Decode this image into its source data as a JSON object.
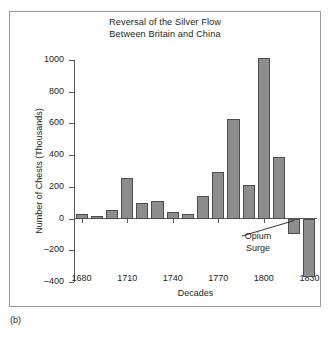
{
  "caption": "(b)",
  "chart_data": {
    "type": "bar",
    "title": "Reversal of the Silver Flow Between Britain and China",
    "title_lines": [
      "Reversal of the Silver Flow",
      "Between Britain and China"
    ],
    "xlabel": "Decades",
    "ylabel": "Number of Chests (Thousands)",
    "ylim": [
      -400,
      1000
    ],
    "yticks": [
      1000,
      800,
      600,
      400,
      200,
      0,
      -200,
      -400
    ],
    "ytick_labels": [
      "1000",
      "800",
      "600",
      "400",
      "200",
      "0",
      "–200",
      "–400"
    ],
    "xticks": [
      1680,
      1710,
      1740,
      1770,
      1800,
      1830
    ],
    "xtick_labels": [
      "1680",
      "1710",
      "1740",
      "1770",
      "1800",
      "1830"
    ],
    "grid": false,
    "legend": null,
    "bar_color": "#8d8d8d",
    "bar_edge_color": "#4d4d4d",
    "categories": [
      1680,
      1690,
      1700,
      1710,
      1720,
      1730,
      1740,
      1750,
      1760,
      1770,
      1780,
      1790,
      1800,
      1810,
      1820,
      1830
    ],
    "values": [
      30,
      15,
      55,
      255,
      100,
      110,
      40,
      30,
      140,
      295,
      630,
      210,
      1010,
      390,
      -95,
      -370
    ],
    "annotations": [
      {
        "text": "Opium Surge",
        "lines": [
          "Opium",
          "Surge"
        ],
        "points_to_decade": 1820
      }
    ]
  }
}
